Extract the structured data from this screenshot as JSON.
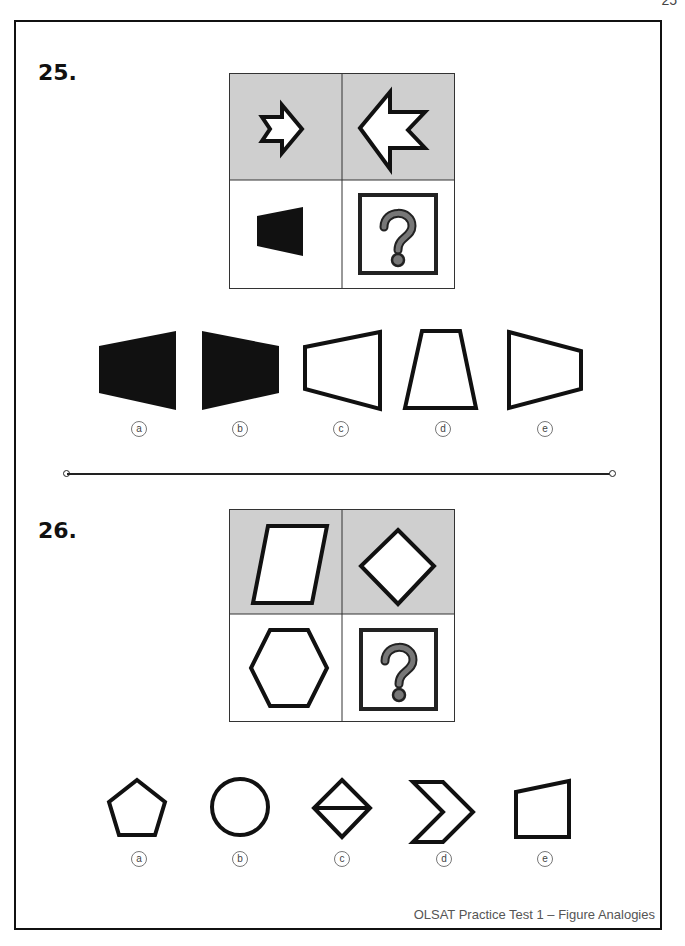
{
  "page_number": "25",
  "questions": [
    {
      "number": "25.",
      "matrix": {
        "top_left": "small-star-arrow-right",
        "top_right": "large-star-arrow-left",
        "bottom_left": "small-black-trapezoid-pointing-left",
        "bottom_right": "question-mark"
      },
      "options": [
        {
          "label": "a",
          "shape": "large-black-trapezoid-left"
        },
        {
          "label": "b",
          "shape": "large-black-trapezoid-right"
        },
        {
          "label": "c",
          "shape": "white-trapezoid-left"
        },
        {
          "label": "d",
          "shape": "white-trapezoid-up"
        },
        {
          "label": "e",
          "shape": "white-trapezoid-right"
        }
      ]
    },
    {
      "number": "26.",
      "matrix": {
        "top_left": "parallelogram",
        "top_right": "diamond",
        "bottom_left": "hexagon",
        "bottom_right": "question-mark"
      },
      "options": [
        {
          "label": "a",
          "shape": "pentagon"
        },
        {
          "label": "b",
          "shape": "circle"
        },
        {
          "label": "c",
          "shape": "diamond-split"
        },
        {
          "label": "d",
          "shape": "chevron"
        },
        {
          "label": "e",
          "shape": "quadrilateral"
        }
      ]
    }
  ],
  "footer": "OLSAT Practice Test 1 – Figure Analogies",
  "colors": {
    "shaded_cell": "#cfcfcf",
    "stroke": "#111111",
    "qmark": "#777777"
  }
}
